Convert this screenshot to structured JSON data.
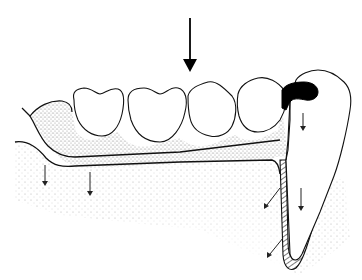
{
  "diagram": {
    "type": "dental-illustration",
    "text_labels": [],
    "colors": {
      "background": "#ffffff",
      "line": "#111111",
      "denture_base_stipple": "#8a8a8a",
      "bone_stipple": "#b5b5b5",
      "rest": "#000000"
    },
    "elements": {
      "load_arrow": {
        "label": "occlusal-force-arrow",
        "x": 190,
        "y_start": 20,
        "y_end": 72
      },
      "denture_teeth": [
        {
          "name": "artificial-tooth-1",
          "cx": 103
        },
        {
          "name": "artificial-tooth-2",
          "cx": 155
        },
        {
          "name": "artificial-tooth-3",
          "cx": 207
        },
        {
          "name": "artificial-tooth-4",
          "cx": 257
        }
      ],
      "abutment_tooth": {
        "name": "abutment-tooth",
        "has_occlusal_rest": true
      },
      "small_arrows": [
        {
          "name": "ridge-arrow-1",
          "x1": 45,
          "y1": 165,
          "x2": 45,
          "y2": 185
        },
        {
          "name": "ridge-arrow-2",
          "x1": 90,
          "y1": 172,
          "x2": 90,
          "y2": 195
        },
        {
          "name": "rest-arrow",
          "x1": 303,
          "y1": 115,
          "x2": 303,
          "y2": 130
        },
        {
          "name": "root-arrow",
          "x1": 301,
          "y1": 188,
          "x2": 301,
          "y2": 210
        },
        {
          "name": "ligament-arrow-1",
          "x1": 280,
          "y1": 188,
          "x2": 265,
          "y2": 207
        },
        {
          "name": "ligament-arrow-2",
          "x1": 282,
          "y1": 238,
          "x2": 268,
          "y2": 256
        }
      ]
    }
  }
}
